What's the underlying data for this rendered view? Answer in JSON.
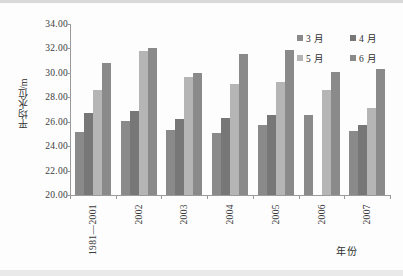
{
  "chart_data": {
    "type": "bar",
    "title": "",
    "xlabel": "年份",
    "ylabel": "平均水位/m",
    "ylim": [
      20.0,
      34.0
    ],
    "ytick_step": 2.0,
    "ytick_labels": [
      "34.00",
      "32.00",
      "30.00",
      "28.00",
      "26.00",
      "24.00",
      "22.00",
      "20.00"
    ],
    "ytick_values": [
      34.0,
      32.0,
      30.0,
      28.0,
      26.0,
      24.0,
      22.0,
      20.0
    ],
    "grid": false,
    "legend_position": "top-right",
    "categories": [
      "1981—2001",
      "2002",
      "2003",
      "2004",
      "2005",
      "2006",
      "2007"
    ],
    "series": [
      {
        "name": "3 月",
        "color": "#8a8a8a",
        "values": [
          25.2,
          26.05,
          25.35,
          25.1,
          25.7,
          26.55,
          25.25
        ]
      },
      {
        "name": "4 月",
        "color": "#777777",
        "values": [
          26.7,
          26.85,
          26.2,
          26.3,
          26.55,
          null,
          25.7
        ]
      },
      {
        "name": "5 月",
        "color": "#b5b5b5",
        "values": [
          28.6,
          31.8,
          29.65,
          29.1,
          29.25,
          28.6,
          27.15
        ]
      },
      {
        "name": "6 月",
        "color": "#8a8a8a",
        "values": [
          30.8,
          32.0,
          29.95,
          31.55,
          31.9,
          30.05,
          30.35
        ]
      }
    ]
  },
  "legend": {
    "entries": [
      {
        "label": "3 月",
        "color": "#8a8a8a"
      },
      {
        "label": "4 月",
        "color": "#777777"
      },
      {
        "label": "5 月",
        "color": "#b5b5b5"
      },
      {
        "label": "6 月",
        "color": "#8a8a8a"
      }
    ]
  },
  "axes": {
    "y_title": "平均水位/m",
    "x_title": "年份"
  }
}
